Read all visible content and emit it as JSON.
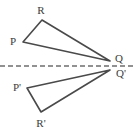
{
  "figure": {
    "width": 134,
    "height": 135,
    "background_color": "#ffffff",
    "stroke_color": "#4a4a4a",
    "label_color": "#3b3b3b",
    "stroke_width": 1.6,
    "mirror_line": {
      "name": "line-of-reflection",
      "orientation": "horizontal",
      "style": "dashed",
      "dash_pattern": "5 3",
      "y": 66,
      "x_start": 0,
      "x_end": 134,
      "color": "#6e6e6e",
      "width": 1.3
    },
    "shapes": [
      {
        "name": "triangle-pqr",
        "position": "above-mirror-line",
        "points": "23,42 42,20 110,61",
        "fill": "none"
      },
      {
        "name": "triangle-pqr-reflected",
        "position": "below-mirror-line",
        "points": "27,88 41,112 110,70",
        "fill": "none"
      }
    ],
    "labels": [
      {
        "name": "vertex-label-p",
        "text": "P",
        "x": 13,
        "y": 41
      },
      {
        "name": "vertex-label-r",
        "text": "R",
        "x": 41,
        "y": 10
      },
      {
        "name": "vertex-label-q",
        "text": "Q",
        "x": 119,
        "y": 58
      },
      {
        "name": "vertex-label-p-prime",
        "text": "P'",
        "x": 17,
        "y": 87
      },
      {
        "name": "vertex-label-r-prime",
        "text": "R'",
        "x": 41,
        "y": 123
      },
      {
        "name": "vertex-label-q-prime",
        "text": "Q'",
        "x": 121,
        "y": 73
      }
    ]
  }
}
